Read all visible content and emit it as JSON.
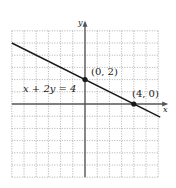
{
  "chart_data": {
    "type": "line",
    "title": "",
    "xlabel": "x",
    "ylabel": "y",
    "xlim": [
      -6,
      6
    ],
    "ylim": [
      -6,
      6
    ],
    "grid": true,
    "grid_style": "dotted",
    "series": [
      {
        "name": "x + 2y = 4",
        "equation": "x + 2y = 4",
        "x": [
          -6,
          6
        ],
        "y": [
          5,
          -1
        ]
      }
    ],
    "points": [
      {
        "x": 0,
        "y": 2,
        "label": "(0, 2)"
      },
      {
        "x": 4,
        "y": 0,
        "label": "(4, 0)"
      }
    ],
    "annotations": [
      {
        "text": "x + 2y = 4",
        "x": -4.5,
        "y": 1.1
      }
    ]
  },
  "labels": {
    "x_axis": "x",
    "y_axis": "y",
    "equation": "x + 2y = 4",
    "point1": "(0, 2)",
    "point2": "(4, 0)"
  },
  "colors": {
    "line": "#1a1a1a",
    "grid": "#9a9a9a",
    "axis": "#555555"
  }
}
